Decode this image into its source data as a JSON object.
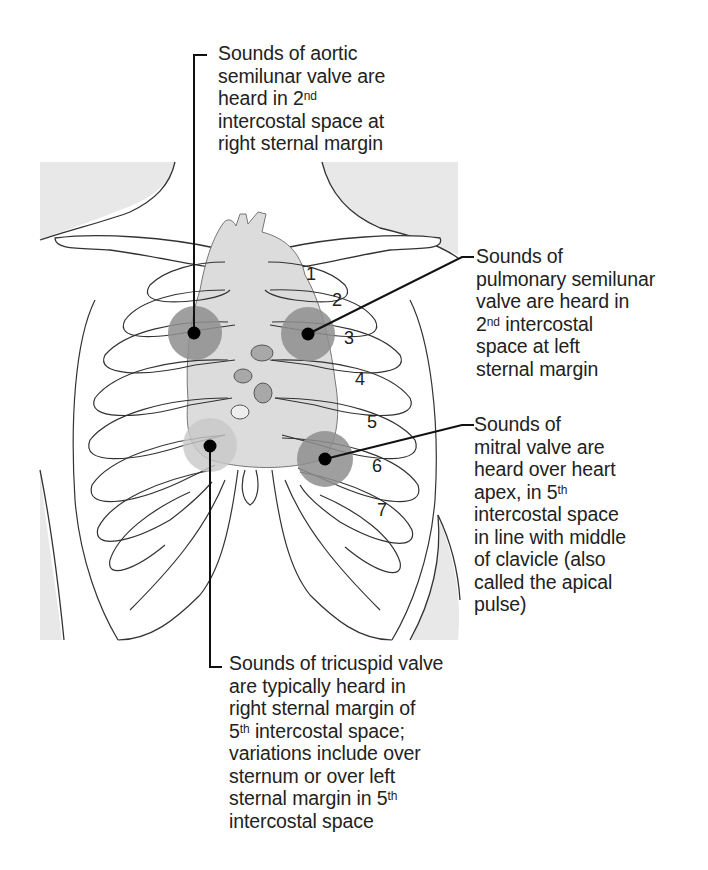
{
  "figure": {
    "colors": {
      "background": "#ffffff",
      "body_shading": "#e8e8e8",
      "heart_fill": "#dcdcdc",
      "strong_zone": "#8e8e8e",
      "light_zone": "#c8c8c8",
      "line": "#222222",
      "marker": "#000000"
    },
    "rib_numbers": [
      "1",
      "2",
      "3",
      "4",
      "5",
      "6",
      "7"
    ]
  },
  "labels": {
    "aortic": {
      "lines": [
        {
          "text": "Sounds of aortic"
        },
        {
          "text": "semilunar valve are"
        },
        {
          "text": "heard in 2",
          "sup": "nd"
        },
        {
          "text": "intercostal space at"
        },
        {
          "text": "right sternal margin"
        }
      ]
    },
    "pulmonary": {
      "lines": [
        {
          "text": "Sounds of"
        },
        {
          "text": "pulmonary semilunar"
        },
        {
          "text": "valve are heard in"
        },
        {
          "text": "2",
          "sup": "nd",
          "after": " intercostal"
        },
        {
          "text": "space at left"
        },
        {
          "text": "sternal margin"
        }
      ]
    },
    "mitral": {
      "lines": [
        {
          "text": "Sounds of"
        },
        {
          "text": "mitral valve are"
        },
        {
          "text": "heard over heart"
        },
        {
          "text": "apex, in 5",
          "sup": "th"
        },
        {
          "text": "intercostal space"
        },
        {
          "text": "in line with middle"
        },
        {
          "text": "of clavicle (also"
        },
        {
          "text": "called the apical"
        },
        {
          "text": "pulse)"
        }
      ]
    },
    "tricuspid": {
      "lines": [
        {
          "text": "Sounds of tricuspid valve"
        },
        {
          "text": "are typically heard in"
        },
        {
          "text": "right sternal margin of"
        },
        {
          "text": "5",
          "sup": "th",
          "after": " intercostal space;"
        },
        {
          "text": "variations include over"
        },
        {
          "text": "sternum or over left"
        },
        {
          "text": "sternal margin in 5",
          "sup": "th"
        },
        {
          "text": "intercostal space"
        }
      ]
    }
  }
}
